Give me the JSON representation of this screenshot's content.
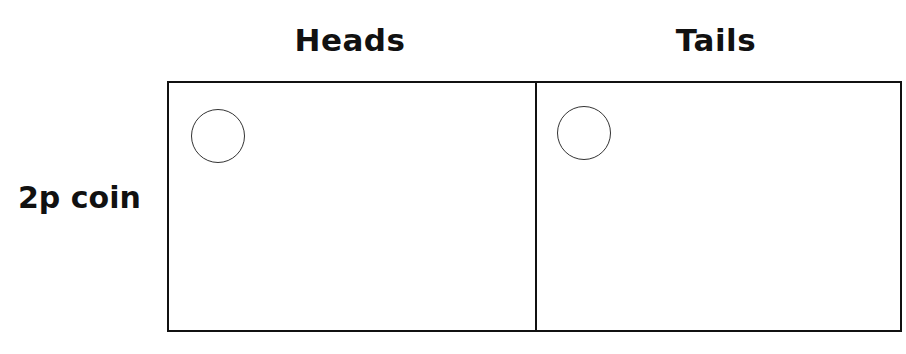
{
  "columns": [
    {
      "label": "Heads"
    },
    {
      "label": "Tails"
    }
  ],
  "rows": [
    {
      "label": "2p coin"
    }
  ],
  "cells": [
    {
      "column": "Heads",
      "row": "2p coin",
      "icon": "coin-circle-icon"
    },
    {
      "column": "Tails",
      "row": "2p coin",
      "icon": "coin-circle-icon"
    }
  ]
}
